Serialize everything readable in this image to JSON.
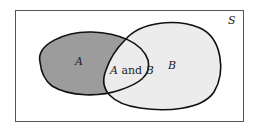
{
  "diagram": {
    "type": "venn",
    "universe_label": "S",
    "sets": [
      {
        "id": "A",
        "label": "A",
        "fill": "#9c9c9c"
      },
      {
        "id": "B",
        "label": "B",
        "fill": "#ececec"
      }
    ],
    "intersection": {
      "label_parts": [
        "A",
        " and ",
        "B"
      ],
      "fill": "#ececec"
    },
    "colors": {
      "border": "#555555",
      "outline": "#111111",
      "background": "#ffffff"
    }
  }
}
